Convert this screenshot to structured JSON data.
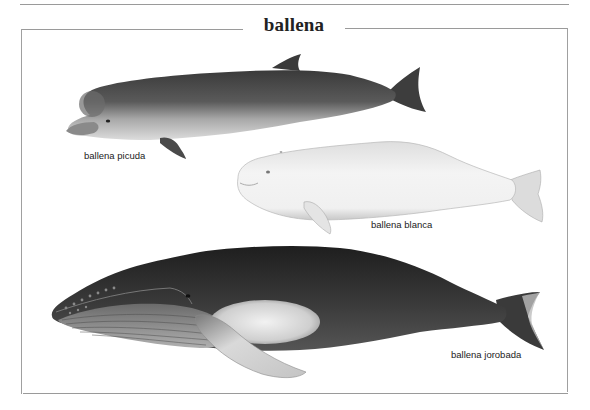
{
  "page": {
    "title": "ballena"
  },
  "whales": [
    {
      "id": "picuda",
      "label": "ballena picuda",
      "tone": "#4a4a4a",
      "belly": "#cfcfcf"
    },
    {
      "id": "blanca",
      "label": "ballena blanca",
      "tone": "#e9e9e9",
      "belly": "#f6f6f6"
    },
    {
      "id": "jorobada",
      "label": "ballena jorobada",
      "tone": "#2e2e2e",
      "belly": "#d8d8d8"
    }
  ],
  "colors": {
    "frame": "#9a9a9a",
    "text": "#222222",
    "background": "#ffffff"
  }
}
